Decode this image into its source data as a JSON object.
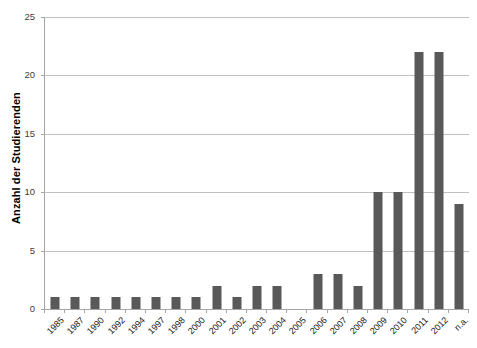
{
  "chart": {
    "title": "",
    "y_axis_title": "Anzahl der Studierenden",
    "x_axis_title": "",
    "bar_color": "#595959",
    "gridline_color": "#bfbfbf",
    "axis_color": "#a6a6a6"
  },
  "chart_data": {
    "type": "bar",
    "title": "",
    "xlabel": "",
    "ylabel": "Anzahl der Studierenden",
    "ylim": [
      0,
      25
    ],
    "yticks": [
      0,
      5,
      10,
      15,
      20,
      25
    ],
    "grid": true,
    "legend": false,
    "categories": [
      "1985",
      "1987",
      "1990",
      "1992",
      "1994",
      "1997",
      "1998",
      "2000",
      "2001",
      "2002",
      "2003",
      "2004",
      "2005",
      "2006",
      "2007",
      "2008",
      "2009",
      "2010",
      "2011",
      "2012",
      "n.a."
    ],
    "values": [
      1,
      1,
      1,
      1,
      1,
      1,
      1,
      1,
      2,
      1,
      2,
      2,
      0,
      3,
      3,
      2,
      10,
      10,
      22,
      22,
      9
    ]
  }
}
